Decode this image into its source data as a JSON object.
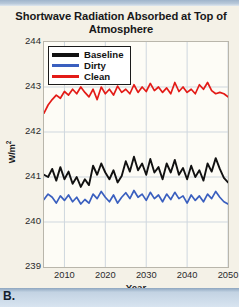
{
  "panel": {
    "label": "B."
  },
  "chart_data": {
    "type": "line",
    "title": "Shortwave Radiation Absorbed at Top of Atmosphere",
    "xlabel": "Year",
    "ylabel": "W/m",
    "ylabel_sup": "2",
    "xlim": [
      2005,
      2050
    ],
    "ylim": [
      239,
      244
    ],
    "yticks": [
      239,
      240,
      241,
      242,
      243,
      244
    ],
    "xticks": [
      2010,
      2020,
      2030,
      2040,
      2050
    ],
    "grid": true,
    "legend_position": "upper-left",
    "colors": {
      "baseline": "#111111",
      "dirty": "#3a5fbf",
      "clean": "#e31b17",
      "plot_background": "#fdfcf6",
      "panel_background": "#f4f1e7",
      "grid": "#cfd7de",
      "frame": "#b9b6ab"
    },
    "legend": [
      {
        "name": "Baseline",
        "color": "#111111"
      },
      {
        "name": "Dirty",
        "color": "#3a5fbf"
      },
      {
        "name": "Clean",
        "color": "#e31b17"
      }
    ],
    "x": [
      2005,
      2006,
      2007,
      2008,
      2009,
      2010,
      2011,
      2012,
      2013,
      2014,
      2015,
      2016,
      2017,
      2018,
      2019,
      2020,
      2021,
      2022,
      2023,
      2024,
      2025,
      2026,
      2027,
      2028,
      2029,
      2030,
      2031,
      2032,
      2033,
      2034,
      2035,
      2036,
      2037,
      2038,
      2039,
      2040,
      2041,
      2042,
      2043,
      2044,
      2045,
      2046,
      2047,
      2048,
      2049,
      2050
    ],
    "series": [
      {
        "name": "Baseline",
        "color": "#111111",
        "values": [
          241.05,
          241.0,
          241.18,
          240.92,
          241.22,
          240.95,
          241.12,
          240.85,
          241.0,
          240.78,
          240.95,
          240.82,
          241.25,
          241.05,
          241.3,
          241.1,
          240.95,
          241.15,
          240.88,
          241.02,
          241.35,
          241.12,
          241.45,
          241.15,
          241.3,
          241.05,
          241.4,
          241.1,
          241.22,
          240.95,
          241.3,
          241.1,
          241.38,
          241.05,
          241.2,
          240.95,
          241.25,
          241.0,
          241.15,
          240.92,
          241.3,
          241.12,
          241.42,
          241.18,
          240.98,
          240.88
        ]
      },
      {
        "name": "Dirty",
        "color": "#3a5fbf",
        "values": [
          240.5,
          240.62,
          240.55,
          240.42,
          240.58,
          240.48,
          240.6,
          240.45,
          240.55,
          240.4,
          240.5,
          240.42,
          240.62,
          240.52,
          240.68,
          240.55,
          240.45,
          240.6,
          240.42,
          240.55,
          240.65,
          240.52,
          240.7,
          240.55,
          240.62,
          240.48,
          240.66,
          240.52,
          240.6,
          240.45,
          240.62,
          240.5,
          240.66,
          240.52,
          240.58,
          240.42,
          240.6,
          240.48,
          240.58,
          240.45,
          240.62,
          240.52,
          240.68,
          240.55,
          240.45,
          240.4
        ]
      },
      {
        "name": "Clean",
        "color": "#e31b17",
        "values": [
          242.42,
          242.6,
          242.72,
          242.82,
          242.75,
          242.9,
          242.82,
          242.95,
          242.85,
          243.0,
          242.88,
          242.78,
          242.95,
          242.72,
          243.0,
          242.85,
          242.95,
          242.82,
          243.02,
          242.88,
          242.95,
          242.85,
          243.05,
          242.88,
          243.0,
          242.9,
          243.08,
          242.92,
          243.0,
          242.88,
          242.98,
          242.85,
          243.1,
          242.9,
          243.0,
          242.88,
          242.95,
          242.85,
          243.05,
          242.95,
          243.1,
          242.92,
          242.85,
          242.88,
          242.85,
          242.78
        ]
      }
    ]
  }
}
